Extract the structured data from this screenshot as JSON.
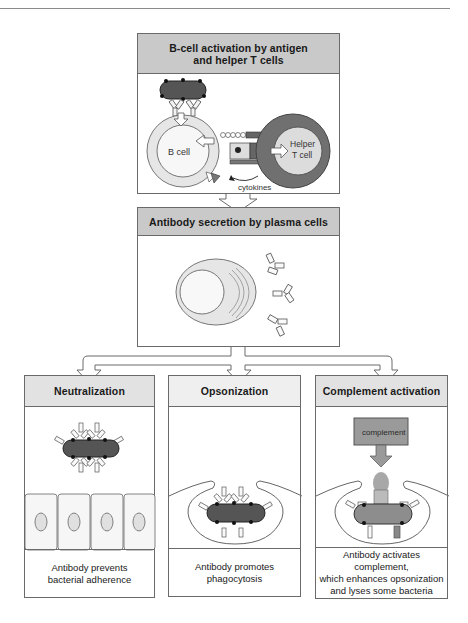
{
  "figure": {
    "stages": [
      {
        "id": "activation",
        "title": "B-cell activation by antigen\nand helper T cells",
        "labels": {
          "b_cell": "B cell",
          "helper_t_cell_line1": "Helper",
          "helper_t_cell_line2": "T cell",
          "cytokines": "cytokines"
        }
      },
      {
        "id": "secretion",
        "title": "Antibody secretion by plasma cells"
      }
    ],
    "outcomes": [
      {
        "id": "neutralization",
        "title": "Neutralization",
        "caption": "Antibody prevents\nbacterial adherence"
      },
      {
        "id": "opsonization",
        "title": "Opsonization",
        "caption": "Antibody promotes\nphagocytosis"
      },
      {
        "id": "complement",
        "title": "Complement activation",
        "caption": "Antibody activates complement,\nwhich enhances opsonization\nand lyses some bacteria",
        "inner_label": "complement"
      }
    ]
  },
  "colors": {
    "header_dark": "#c9c9c9",
    "header_light": "#e2e2e2",
    "bacterium": "#5a5a5a",
    "b_cell_fill": "#e4e4e4",
    "t_cell_outer": "#6e6e6e",
    "t_cell_inner": "#d8d8d8",
    "complement_box": "#9a9a9a"
  }
}
